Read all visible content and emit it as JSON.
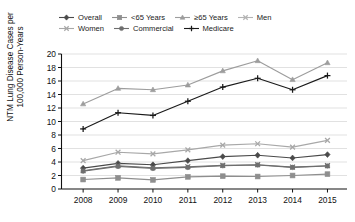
{
  "chart_data": {
    "type": "line",
    "title": "",
    "xlabel": "",
    "ylabel": "NTM Lung Disease Cases per 100,000 Person-Years",
    "ylabel_line1": "NTM Lung Disease Cases per",
    "ylabel_line2": "100,000 Person-Years",
    "categories": [
      "2008",
      "2009",
      "2010",
      "2011",
      "2012",
      "2013",
      "2014",
      "2015"
    ],
    "x": [
      2008,
      2009,
      2010,
      2011,
      2012,
      2013,
      2014,
      2015
    ],
    "ylim": [
      0,
      20
    ],
    "ytick_values": [
      0,
      2,
      4,
      6,
      8,
      10,
      12,
      14,
      16,
      18,
      20
    ],
    "ytick_labels": [
      "0",
      "2",
      "4",
      "6",
      "8",
      "10",
      "12",
      "14",
      "16",
      "18",
      "20"
    ],
    "grid": true,
    "legend_position": "top",
    "series": [
      {
        "name": "Overall",
        "marker": "diamond",
        "color": "#4a4a4a",
        "values": [
          3.1,
          3.8,
          3.6,
          4.2,
          4.8,
          5.0,
          4.6,
          5.1
        ]
      },
      {
        "name": "<65 Years",
        "marker": "square",
        "color": "#8e8e8e",
        "values": [
          1.4,
          1.65,
          1.35,
          1.8,
          1.9,
          1.85,
          2.0,
          2.2
        ]
      },
      {
        "name": "≥65 Years",
        "marker": "triangle",
        "color": "#9d9d9d",
        "values": [
          12.6,
          14.9,
          14.7,
          15.4,
          17.5,
          19.0,
          16.2,
          18.7
        ]
      },
      {
        "name": "Men",
        "marker": "cross",
        "color": "#707070",
        "values": [
          2.7,
          3.45,
          3.15,
          3.3,
          3.5,
          3.6,
          3.25,
          3.45
        ]
      },
      {
        "name": "Women",
        "marker": "cross",
        "color": "#a8a8a8",
        "values": [
          4.2,
          5.45,
          5.2,
          5.8,
          6.5,
          6.7,
          6.2,
          7.2
        ]
      },
      {
        "name": "Commercial",
        "marker": "circle",
        "color": "#6e6e6e",
        "values": [
          2.65,
          3.35,
          3.05,
          3.2,
          3.45,
          3.55,
          3.2,
          3.4
        ]
      },
      {
        "name": "Medicare",
        "marker": "plus",
        "color": "#1a1a1a",
        "values": [
          8.9,
          11.3,
          10.9,
          13.0,
          15.1,
          16.4,
          14.7,
          16.8
        ]
      }
    ]
  },
  "legend": {
    "items": [
      {
        "label": "Overall",
        "marker": "diamond",
        "color": "#4a4a4a"
      },
      {
        "label": "<65 Years",
        "marker": "square",
        "color": "#8e8e8e"
      },
      {
        "label": "≥65 Years",
        "marker": "triangle",
        "color": "#9d9d9d"
      },
      {
        "label": "Men",
        "marker": "cross",
        "color": "#b4b4b4"
      },
      {
        "label": "Women",
        "marker": "cross",
        "color": "#a8a8a8"
      },
      {
        "label": "Commercial",
        "marker": "circle",
        "color": "#6e6e6e"
      },
      {
        "label": "Medicare",
        "marker": "plus",
        "color": "#1a1a1a"
      }
    ]
  },
  "axes": {
    "y_title_line1": "NTM Lung Disease Cases per",
    "y_title_line2": "100,000 Person-Years"
  }
}
